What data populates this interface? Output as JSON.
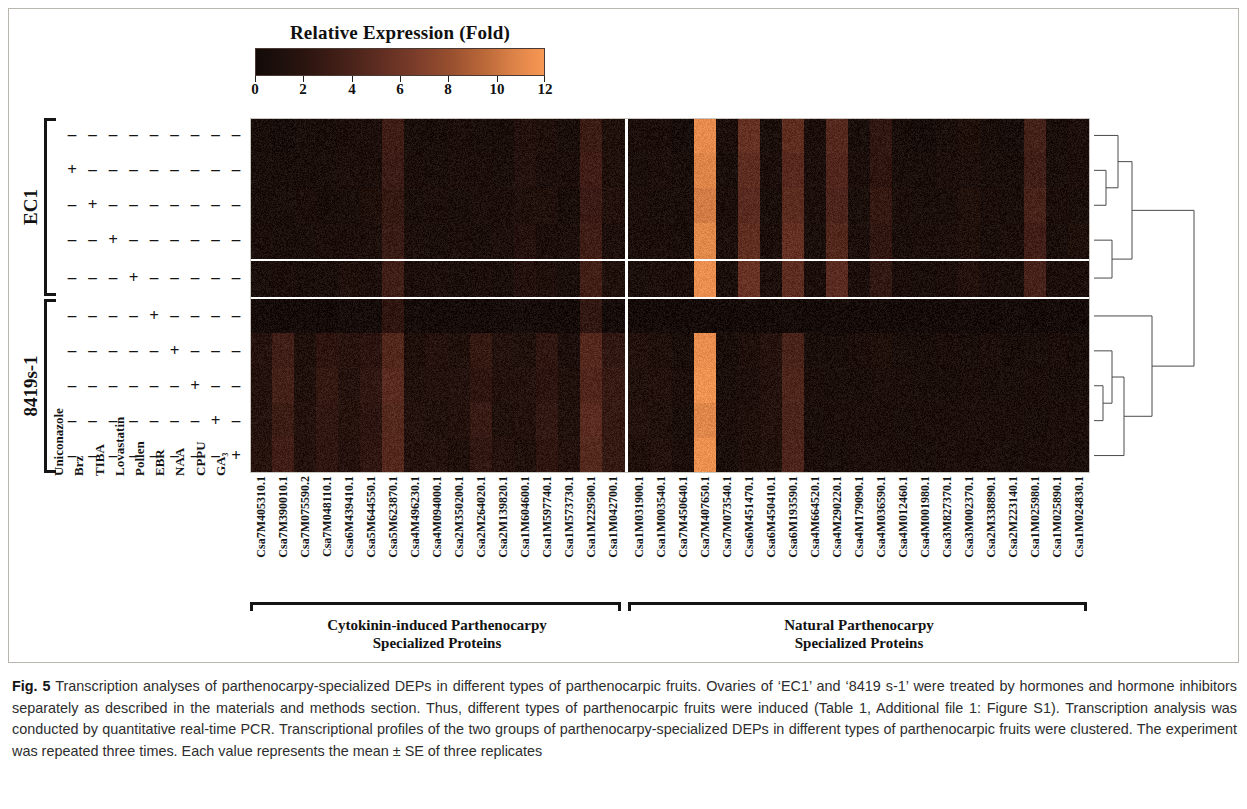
{
  "colorbar": {
    "title": "Relative Expression (Fold)",
    "ticks": [
      "0",
      "2",
      "4",
      "6",
      "8",
      "10",
      "12"
    ],
    "min": 0,
    "max": 12,
    "low_color": "#130a08",
    "mid_color": "#7a3c2a",
    "high_color": "#f79a55"
  },
  "sample_groups": [
    {
      "label": "EC1",
      "rows": 5
    },
    {
      "label": "8419s-1",
      "rows": 5
    }
  ],
  "treatments": [
    "Uniconazole",
    "Brz",
    "TIBA",
    "Lovastatin",
    "Pollen",
    "EBR",
    "NAA",
    "CPPU",
    "GA₃"
  ],
  "treatment_matrix": [
    [
      "-",
      "-",
      "-",
      "-",
      "-",
      "-",
      "-",
      "-",
      "-"
    ],
    [
      "+",
      "-",
      "-",
      "-",
      "-",
      "-",
      "-",
      "-",
      "-"
    ],
    [
      "-",
      "+",
      "-",
      "-",
      "-",
      "-",
      "-",
      "-",
      "-"
    ],
    [
      "-",
      "-",
      "+",
      "-",
      "-",
      "-",
      "-",
      "-",
      "-"
    ],
    [
      "-",
      "-",
      "-",
      "+",
      "-",
      "-",
      "-",
      "-",
      "-"
    ],
    [
      "-",
      "-",
      "-",
      "-",
      "+",
      "-",
      "-",
      "-",
      "-"
    ],
    [
      "-",
      "-",
      "-",
      "-",
      "-",
      "+",
      "-",
      "-",
      "-"
    ],
    [
      "-",
      "-",
      "-",
      "-",
      "-",
      "-",
      "+",
      "-",
      "-"
    ],
    [
      "-",
      "-",
      "-",
      "-",
      "-",
      "-",
      "-",
      "+",
      "-"
    ],
    [
      "-",
      "-",
      "-",
      "-",
      "-",
      "-",
      "-",
      "-",
      "+"
    ]
  ],
  "gene_groups": [
    {
      "label_line1": "Cytokinin-induced Parthenocarpy",
      "label_line2": "Specialized Proteins",
      "count": 17
    },
    {
      "label_line1": "Natural Parthenocarpy",
      "label_line2": "Specialized Proteins",
      "count": 21
    }
  ],
  "genes": [
    "Csa7M405310.1",
    "Csa7M390010.1",
    "Csa7M075590.2",
    "Csa7M048110.1",
    "Csa6M439410.1",
    "Csa5M644550.1",
    "Csa5M623870.1",
    "Csa4M496230.1",
    "Csa4M094000.1",
    "Csa2M350200.1",
    "Csa2M264020.1",
    "Csa2M139820.1",
    "Csa1M604600.1",
    "Csa1M597740.1",
    "Csa1M573730.1",
    "Csa1M229500.1",
    "Csa1M042700.1",
    "Csa1M031900.1",
    "Csa1M003540.1",
    "Csa7M450640.1",
    "Csa7M407650.1",
    "Csa7M073540.1",
    "Csa6M451470.1",
    "Csa6M450410.1",
    "Csa6M193590.1",
    "Csa4M664520.1",
    "Csa4M290220.1",
    "Csa4M179090.1",
    "Csa4M036590.1",
    "Csa4M012460.1",
    "Csa4M001980.1",
    "Csa3M827370.1",
    "Csa3M002370.1",
    "Csa2M338890.1",
    "Csa2M223140.1",
    "Csa1M025980.1",
    "Csa1M025890.1",
    "Csa1M024830.1"
  ],
  "chart_data": {
    "type": "heatmap",
    "title": "Relative Expression (Fold)",
    "xlabel": "Parthenocarpy-specialized DEPs",
    "ylabel": "Parthenocarpic fruit treatment",
    "zlim": [
      0,
      12
    ],
    "colormap": "black-maroon-orange",
    "grid": false,
    "legend_position": "top",
    "x_categories": [
      "Csa7M405310.1",
      "Csa7M390010.1",
      "Csa7M075590.2",
      "Csa7M048110.1",
      "Csa6M439410.1",
      "Csa5M644550.1",
      "Csa5M623870.1",
      "Csa4M496230.1",
      "Csa4M094000.1",
      "Csa2M350200.1",
      "Csa2M264020.1",
      "Csa2M139820.1",
      "Csa1M604600.1",
      "Csa1M597740.1",
      "Csa1M573730.1",
      "Csa1M229500.1",
      "Csa1M042700.1",
      "Csa1M031900.1",
      "Csa1M003540.1",
      "Csa7M450640.1",
      "Csa7M407650.1",
      "Csa7M073540.1",
      "Csa6M451470.1",
      "Csa6M450410.1",
      "Csa6M193590.1",
      "Csa4M664520.1",
      "Csa4M290220.1",
      "Csa4M179090.1",
      "Csa4M036590.1",
      "Csa4M012460.1",
      "Csa4M001980.1",
      "Csa3M827370.1",
      "Csa3M002370.1",
      "Csa2M338890.1",
      "Csa2M223140.1",
      "Csa1M025980.1",
      "Csa1M025890.1",
      "Csa1M024830.1"
    ],
    "y_categories": [
      "EC1 / control",
      "EC1 / Uniconazole",
      "EC1 / Brz",
      "EC1 / TIBA",
      "EC1 / Lovastatin",
      "8419s-1 / Pollen",
      "8419s-1 / EBR",
      "8419s-1 / NAA",
      "8419s-1 / CPPU",
      "8419s-1 / GA3"
    ],
    "values": [
      [
        0.8,
        0.7,
        0.9,
        0.8,
        1.0,
        1.1,
        3.2,
        0.9,
        0.8,
        1.0,
        0.9,
        0.8,
        1.4,
        1.2,
        0.9,
        3.1,
        1.3,
        1.0,
        1.0,
        0.7,
        11.2,
        1.0,
        5.4,
        0.9,
        5.1,
        1.0,
        4.6,
        0.9,
        2.4,
        0.8,
        0.7,
        0.9,
        1.2,
        0.8,
        0.7,
        3.6,
        0.8,
        1.1
      ],
      [
        0.9,
        0.8,
        0.8,
        0.9,
        1.1,
        1.0,
        3.0,
        1.0,
        0.9,
        1.1,
        1.0,
        0.9,
        1.5,
        1.1,
        1.0,
        3.4,
        1.2,
        0.9,
        1.1,
        0.8,
        10.8,
        0.9,
        5.0,
        1.0,
        4.7,
        1.1,
        4.3,
        1.0,
        2.2,
        0.9,
        0.8,
        1.0,
        1.1,
        0.9,
        0.8,
        3.3,
        0.9,
        1.0
      ],
      [
        0.8,
        0.9,
        1.0,
        0.8,
        0.9,
        1.2,
        2.6,
        0.9,
        1.0,
        0.9,
        1.1,
        1.0,
        1.3,
        1.3,
        0.8,
        3.0,
        1.4,
        1.1,
        0.9,
        0.9,
        10.4,
        1.0,
        4.8,
        0.9,
        4.9,
        1.0,
        4.1,
        0.9,
        2.6,
        1.0,
        0.9,
        0.9,
        1.3,
        1.0,
        0.9,
        3.8,
        1.0,
        0.9
      ],
      [
        1.0,
        0.8,
        0.9,
        1.0,
        1.0,
        1.1,
        2.9,
        1.1,
        0.9,
        1.0,
        0.9,
        1.1,
        1.6,
        1.0,
        1.1,
        3.2,
        1.1,
        1.0,
        1.0,
        0.8,
        11.0,
        1.1,
        5.2,
        1.0,
        5.3,
        0.9,
        4.4,
        1.1,
        2.3,
        0.9,
        1.0,
        1.1,
        1.2,
        0.9,
        1.0,
        3.4,
        0.9,
        1.2
      ],
      [
        0.9,
        1.0,
        0.8,
        0.9,
        1.2,
        1.0,
        3.3,
        1.0,
        1.1,
        0.9,
        1.0,
        0.9,
        1.4,
        1.2,
        0.9,
        3.5,
        1.3,
        0.9,
        1.1,
        1.0,
        11.4,
        0.9,
        5.6,
        1.1,
        5.0,
        1.0,
        4.8,
        1.0,
        2.5,
        1.0,
        0.9,
        1.0,
        1.4,
        1.0,
        0.9,
        3.7,
        1.0,
        1.0
      ],
      [
        0.6,
        0.5,
        0.6,
        0.5,
        0.7,
        0.6,
        2.2,
        0.6,
        0.5,
        0.6,
        0.5,
        0.6,
        0.7,
        0.6,
        0.5,
        2.4,
        0.6,
        0.5,
        0.6,
        0.5,
        0.6,
        0.5,
        0.6,
        0.5,
        0.6,
        0.5,
        0.6,
        0.5,
        0.6,
        0.5,
        0.6,
        0.5,
        0.6,
        0.5,
        0.6,
        0.5,
        0.6,
        0.5
      ],
      [
        1.6,
        3.3,
        1.2,
        2.2,
        1.8,
        2.0,
        4.4,
        1.2,
        1.6,
        1.3,
        2.6,
        1.5,
        1.3,
        2.3,
        1.1,
        4.6,
        2.5,
        1.4,
        1.2,
        0.9,
        11.3,
        0.8,
        1.2,
        1.6,
        3.9,
        0.9,
        0.8,
        1.0,
        1.2,
        0.9,
        0.8,
        1.0,
        0.9,
        1.1,
        0.8,
        0.9,
        1.0,
        0.8
      ],
      [
        1.4,
        3.6,
        1.3,
        2.6,
        1.5,
        2.4,
        4.8,
        1.3,
        1.4,
        1.5,
        2.2,
        1.4,
        1.5,
        2.1,
        1.2,
        4.3,
        2.8,
        1.3,
        1.4,
        1.0,
        11.6,
        0.9,
        1.1,
        1.4,
        4.2,
        1.0,
        0.9,
        0.9,
        1.1,
        1.0,
        0.9,
        0.9,
        1.0,
        0.9,
        0.9,
        1.0,
        0.9,
        0.9
      ],
      [
        1.5,
        3.1,
        1.5,
        2.4,
        1.7,
        2.1,
        4.5,
        1.5,
        1.3,
        1.4,
        2.8,
        1.3,
        1.4,
        2.5,
        1.3,
        4.8,
        2.6,
        1.5,
        1.3,
        0.9,
        10.9,
        1.0,
        1.3,
        1.5,
        4.0,
        0.9,
        1.0,
        1.0,
        1.0,
        0.9,
        1.0,
        1.0,
        1.1,
        1.0,
        1.0,
        0.9,
        1.0,
        1.0
      ],
      [
        1.7,
        3.4,
        1.4,
        2.3,
        1.6,
        2.3,
        4.6,
        1.4,
        1.5,
        1.2,
        2.4,
        1.6,
        1.2,
        2.2,
        1.4,
        4.5,
        2.7,
        1.2,
        1.5,
        1.0,
        11.5,
        0.9,
        1.2,
        1.3,
        4.1,
        1.0,
        0.9,
        1.1,
        1.1,
        1.0,
        0.9,
        1.1,
        1.0,
        1.1,
        0.9,
        1.0,
        1.1,
        0.9
      ]
    ]
  },
  "dendrogram": {
    "description": "hierarchical clustering of the 10 treatment rows, drawn at the right of the heat map",
    "leaf_count": 10
  },
  "caption": {
    "figure_number": "Fig. 5",
    "text": " Transcription analyses of parthenocarpy-specialized DEPs in different types of parthenocarpic fruits. Ovaries of ‘EC1’ and ‘8419 s-1’ were treated by hormones and hormone inhibitors separately as described in the materials and methods section. Thus, different types of parthenocarpic fruits were induced (Table 1, Additional file 1: Figure S1). Transcription analysis was conducted by quantitative real-time PCR. Transcriptional profiles of the two groups of parthenocarpy-specialized DEPs in different types of parthenocarpic fruits were clustered. The experiment was repeated three times. Each value represents the mean ± SE of three replicates"
  }
}
